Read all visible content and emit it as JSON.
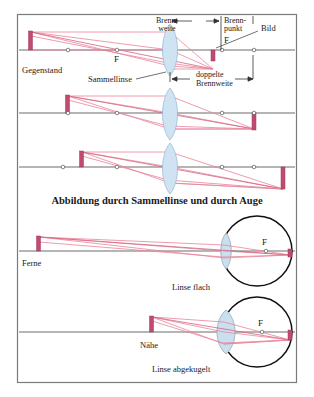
{
  "figure": {
    "title": "Abbildung durch Sammellinse und durch Auge",
    "panel1": {
      "object_label": "Gegenstand",
      "lens_label": "Sammellinse",
      "focal_point_left": "F",
      "focal_point_right": "F",
      "focal_length_label_line1": "Brenn-",
      "focal_length_label_line2": "weite",
      "focal_point_label_line1": "Brenn-",
      "focal_point_label_line2": "punkt",
      "image_label": "Bild",
      "double_focal_line1": "doppelte",
      "double_focal_line2": "Brennweite"
    },
    "panel4": {
      "object_label": "Ferne",
      "focal_point": "F",
      "caption": "Linse flach"
    },
    "panel5": {
      "object_label": "Nähe",
      "focal_point": "F",
      "caption": "Linse abgekugelt"
    }
  },
  "colors": {
    "ray": "#e8849b",
    "object": "#c04a72",
    "lens": "#cfe3f2",
    "axis": "#6d6d6d",
    "eye": "#111111",
    "frame": "#7b7b7b"
  }
}
